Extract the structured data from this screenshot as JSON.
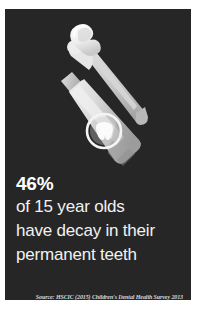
{
  "card": {
    "background_color": "#262626",
    "page_background_color": "#ffffff"
  },
  "illustration": {
    "alt": "toothbrush with toothpaste and toothpaste tube",
    "toothbrush_label": "toothbrush",
    "toothpaste_swirl_label": "toothpaste swirl",
    "tube_label": "toothpaste tube",
    "tooth_logo_label": "tooth logo",
    "colors": {
      "brush_handle": "#c9c9c9",
      "brush_head": "#e8e8e8",
      "paste_swirl": "#fbfbfb",
      "tube_body_light": "#e3e3e3",
      "tube_body_mid": "#c4c4c4",
      "tube_body_dark": "#a8a8a8",
      "tube_cap": "#d0d0d0",
      "logo": "#f2f2f2"
    }
  },
  "stat": {
    "percent": "46%",
    "lines": [
      "of 15 year olds",
      "have decay in their",
      "permanent teeth"
    ],
    "text_color": "#f2f2f2"
  },
  "source": {
    "text": "Source: HSCIC (2015) Children's Dental Health Survey 2013"
  }
}
